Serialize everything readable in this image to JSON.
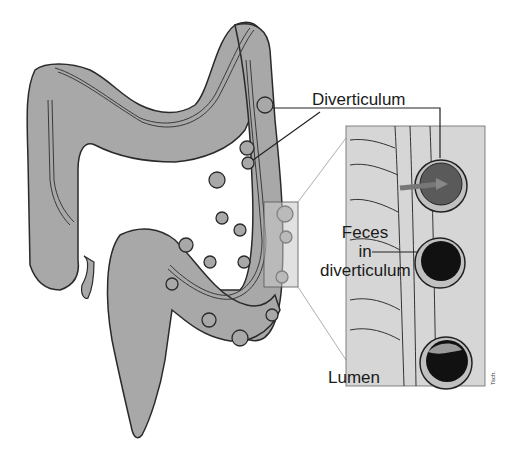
{
  "diagram": {
    "labels": {
      "diverticulum": "Diverticulum",
      "feces_line1": "Feces",
      "feces_line2": "in",
      "feces_line3": "diverticulum",
      "lumen": "Lumen"
    },
    "signature": "Tsch.",
    "colors": {
      "colon_fill": "#a8a8a8",
      "outline": "#2a2a2a",
      "inset_bg": "#d6d6d6",
      "highlight_box": "#c8c8c8",
      "feces": "#111111"
    }
  }
}
